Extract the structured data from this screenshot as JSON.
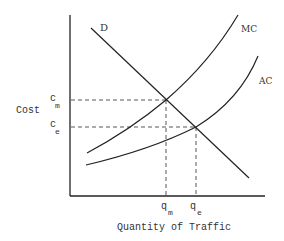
{
  "diagram": {
    "axes": {
      "ylabel": "Cost",
      "xlabel": "Quantity of Traffic"
    },
    "curves": {
      "demand": "D",
      "marginal_cost": "MC",
      "average_cost": "AC"
    },
    "y_marks": {
      "cm": {
        "base": "c",
        "sub": "m"
      },
      "ce": {
        "base": "c",
        "sub": "e"
      }
    },
    "x_marks": {
      "qm": {
        "base": "q",
        "sub": "m"
      },
      "qe": {
        "base": "q",
        "sub": "e"
      }
    },
    "colors": {
      "line": "#2a2a2a",
      "text": "#333333"
    }
  }
}
